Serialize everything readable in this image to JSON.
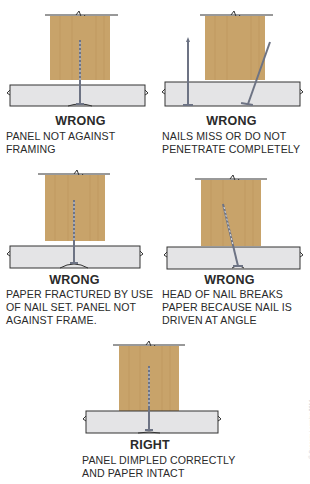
{
  "colors": {
    "wood": "#c8a36a",
    "wood_grain": "#b48a50",
    "panel_fill": "#e4e4e6",
    "panel_edge": "#9a9aa0",
    "line": "#333333",
    "nail": "#6d7384"
  },
  "figures": [
    {
      "id": "fig1",
      "verdict": "WRONG",
      "caption": "PANEL NOT AGAINST\nFRAMING"
    },
    {
      "id": "fig2",
      "verdict": "WRONG",
      "caption": "NAILS MISS OR DO NOT\nPENETRATE COMPLETELY"
    },
    {
      "id": "fig3",
      "verdict": "WRONG",
      "caption": "PAPER FRACTURED BY USE\nOF NAIL SET. PANEL NOT\nAGAINST FRAME."
    },
    {
      "id": "fig4",
      "verdict": "WRONG",
      "caption": "HEAD OF NAIL BREAKS\nPAPER BECAUSE NAIL IS\nDRIVEN AT ANGLE"
    },
    {
      "id": "fig5",
      "verdict": "RIGHT",
      "caption": "PANEL DIMPLED CORRECTLY\nAND PAPER INTACT"
    }
  ],
  "copyright": "© Cengage Learning 2014"
}
